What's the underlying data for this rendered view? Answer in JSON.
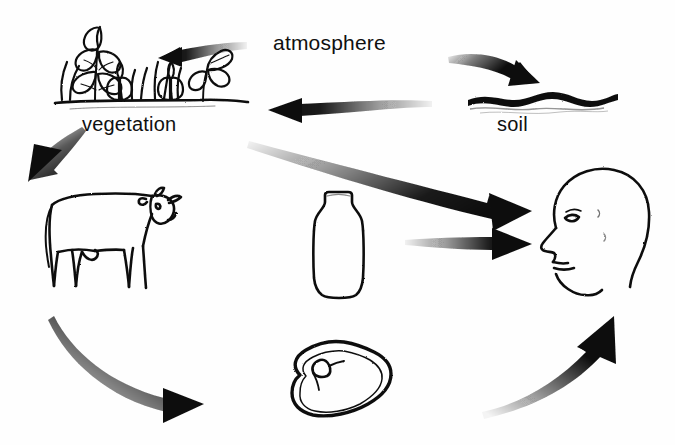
{
  "diagram": {
    "background_color": "#fefefe",
    "ink_color": "#111111",
    "labels": [
      {
        "id": "atmosphere",
        "text": "atmosphere"
      },
      {
        "id": "vegetation",
        "text": "vegetation"
      },
      {
        "id": "soil",
        "text": "soil"
      }
    ],
    "nodes": [
      {
        "id": "vegetation",
        "name": "vegetation-illustration",
        "description": "cluster of leafy plants and grass on ground line"
      },
      {
        "id": "soil",
        "name": "soil-illustration",
        "description": "wavy ground surface line"
      },
      {
        "id": "cow",
        "name": "cow-illustration",
        "description": "outline drawing of a cow in side profile facing right"
      },
      {
        "id": "bottle",
        "name": "milk-bottle-illustration",
        "description": "outline drawing of a milk bottle"
      },
      {
        "id": "meat",
        "name": "meat-cut-illustration",
        "description": "outline drawing of a cut of meat / steak"
      },
      {
        "id": "human",
        "name": "human-head-illustration",
        "description": "outline drawing of a human head in left-facing profile"
      }
    ],
    "arrows": [
      {
        "id": "atmosphere-to-vegetation",
        "from": "atmosphere",
        "to": "vegetation",
        "style": "tapered-straight",
        "direction": "left"
      },
      {
        "id": "atmosphere-to-soil",
        "from": "atmosphere",
        "to": "soil",
        "style": "tapered-curved",
        "direction": "down-right"
      },
      {
        "id": "soil-to-vegetation",
        "from": "soil",
        "to": "vegetation",
        "style": "tapered-straight",
        "direction": "left"
      },
      {
        "id": "vegetation-to-cow",
        "from": "vegetation",
        "to": "cow",
        "style": "tapered-straight",
        "direction": "down-left"
      },
      {
        "id": "vegetation-to-human",
        "from": "vegetation",
        "to": "human",
        "style": "tapered-straight",
        "direction": "down-right"
      },
      {
        "id": "bottle-to-human",
        "from": "bottle",
        "to": "human",
        "style": "tapered-straight",
        "direction": "right"
      },
      {
        "id": "cow-to-meat",
        "from": "cow",
        "to": "meat",
        "style": "tapered-curved",
        "direction": "down-right"
      },
      {
        "id": "meat-to-human",
        "from": "meat",
        "to": "human",
        "style": "tapered-curved",
        "direction": "up-right"
      }
    ]
  }
}
